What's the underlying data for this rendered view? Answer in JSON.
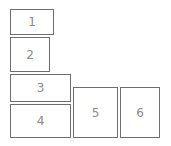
{
  "boxes": [
    {
      "label": "1"
    },
    {
      "label": "2"
    },
    {
      "label": "3"
    },
    {
      "label": "4"
    },
    {
      "label": "5"
    },
    {
      "label": "6"
    }
  ]
}
